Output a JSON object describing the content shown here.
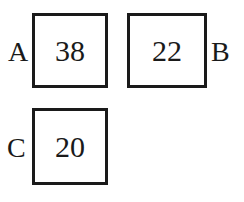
{
  "boxes": [
    {
      "label": "A",
      "value": "38",
      "label_side": "left"
    },
    {
      "label": "B",
      "value": "22",
      "label_side": "right"
    },
    {
      "label": "C",
      "value": "20",
      "label_side": "left"
    }
  ],
  "colors": {
    "stroke": "#1a1a1a",
    "background": "#ffffff"
  }
}
